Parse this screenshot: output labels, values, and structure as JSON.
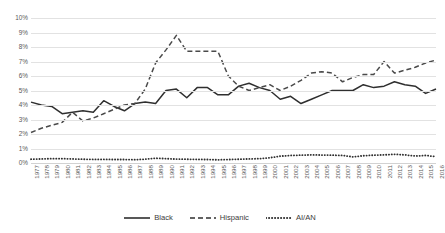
{
  "chart_data": {
    "type": "line",
    "title": "",
    "subtitle": "",
    "xlabel": "",
    "ylabel": "",
    "ylim": [
      0,
      10
    ],
    "ytick_labels": [
      "0%",
      "1%",
      "2%",
      "3%",
      "4%",
      "5%",
      "6%",
      "7%",
      "8%",
      "9%",
      "10%"
    ],
    "ytick_values": [
      0,
      1,
      2,
      3,
      4,
      5,
      6,
      7,
      8,
      9,
      10
    ],
    "grid": true,
    "legend_position": "bottom",
    "categories": [
      "1977",
      "1978",
      "1979",
      "1980",
      "1981",
      "1982",
      "1983",
      "1984",
      "1985",
      "1986",
      "1987",
      "1988",
      "1989",
      "1990",
      "1991",
      "1992",
      "1993",
      "1994",
      "1995",
      "1996",
      "1997",
      "1998",
      "1999",
      "2000",
      "2001",
      "2002",
      "2003",
      "2004",
      "2005",
      "2006",
      "2007",
      "2008",
      "2009",
      "2010",
      "2011",
      "2012",
      "2013",
      "2014",
      "2015",
      "2016"
    ],
    "series": [
      {
        "name": "Black",
        "style": "solid",
        "color": "#2f2f2f",
        "values": [
          4.2,
          4.0,
          3.9,
          3.4,
          3.5,
          3.6,
          3.5,
          4.3,
          3.9,
          3.6,
          4.1,
          4.2,
          4.1,
          5.0,
          5.1,
          4.5,
          5.2,
          5.2,
          4.7,
          4.7,
          5.3,
          5.5,
          5.2,
          5.0,
          4.4,
          4.6,
          4.1,
          4.4,
          4.7,
          5.0,
          5.0,
          5.0,
          5.4,
          5.2,
          5.3,
          5.6,
          5.4,
          5.3,
          4.8,
          5.1
        ]
      },
      {
        "name": "Hispanic",
        "style": "dashed",
        "color": "#4a4a4a",
        "values": [
          2.1,
          2.4,
          2.6,
          2.8,
          3.5,
          2.9,
          3.1,
          3.4,
          3.7,
          4.0,
          4.1,
          5.1,
          6.9,
          7.8,
          8.8,
          7.7,
          7.7,
          7.7,
          7.7,
          6.0,
          5.3,
          5.0,
          5.2,
          5.4,
          5.0,
          5.3,
          5.7,
          6.2,
          6.3,
          6.2,
          5.6,
          5.9,
          6.1,
          6.1,
          7.0,
          6.2,
          6.4,
          6.6,
          6.9,
          7.1
        ]
      },
      {
        "name": "AI/AN",
        "style": "dotted",
        "color": "#2f2f2f",
        "values": [
          0.26,
          0.28,
          0.3,
          0.3,
          0.28,
          0.26,
          0.25,
          0.25,
          0.24,
          0.24,
          0.23,
          0.26,
          0.33,
          0.3,
          0.27,
          0.26,
          0.25,
          0.24,
          0.22,
          0.24,
          0.26,
          0.28,
          0.3,
          0.36,
          0.47,
          0.52,
          0.54,
          0.56,
          0.55,
          0.54,
          0.52,
          0.42,
          0.5,
          0.54,
          0.56,
          0.6,
          0.56,
          0.48,
          0.52,
          0.44
        ]
      }
    ]
  },
  "legend": {
    "items": [
      {
        "label": "Black",
        "style": "solid"
      },
      {
        "label": "Hispanic",
        "style": "dashed"
      },
      {
        "label": "AI/AN",
        "style": "dotted"
      }
    ]
  }
}
